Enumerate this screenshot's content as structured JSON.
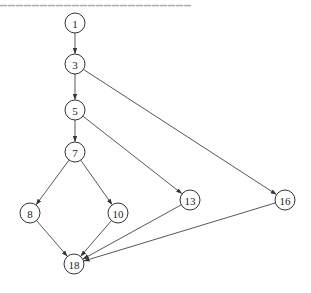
{
  "diagram": {
    "type": "control-flow-graph",
    "top_fragment": "▁▁▁▁▁▁▁▁▁▁▁▁▁▁▁▁▁▁▁▁▁▁▁▁",
    "colors": {
      "stroke": "#333333",
      "background": "#ffffff",
      "text": "#222222"
    },
    "node_radius": 10,
    "nodes": [
      {
        "id": "1",
        "label": "1",
        "x": 75,
        "y": 23
      },
      {
        "id": "3",
        "label": "3",
        "x": 75,
        "y": 64
      },
      {
        "id": "5",
        "label": "5",
        "x": 75,
        "y": 110
      },
      {
        "id": "7",
        "label": "7",
        "x": 75,
        "y": 152
      },
      {
        "id": "8",
        "label": "8",
        "x": 30,
        "y": 213
      },
      {
        "id": "10",
        "label": "10",
        "x": 118,
        "y": 213
      },
      {
        "id": "13",
        "label": "13",
        "x": 190,
        "y": 200
      },
      {
        "id": "16",
        "label": "16",
        "x": 285,
        "y": 200
      },
      {
        "id": "18",
        "label": "18",
        "x": 74,
        "y": 264
      }
    ],
    "edges": [
      {
        "from": "1",
        "to": "3"
      },
      {
        "from": "3",
        "to": "5"
      },
      {
        "from": "3",
        "to": "16"
      },
      {
        "from": "5",
        "to": "7"
      },
      {
        "from": "5",
        "to": "13"
      },
      {
        "from": "7",
        "to": "8"
      },
      {
        "from": "7",
        "to": "10"
      },
      {
        "from": "8",
        "to": "18"
      },
      {
        "from": "10",
        "to": "18"
      },
      {
        "from": "13",
        "to": "18"
      },
      {
        "from": "16",
        "to": "18"
      }
    ]
  }
}
